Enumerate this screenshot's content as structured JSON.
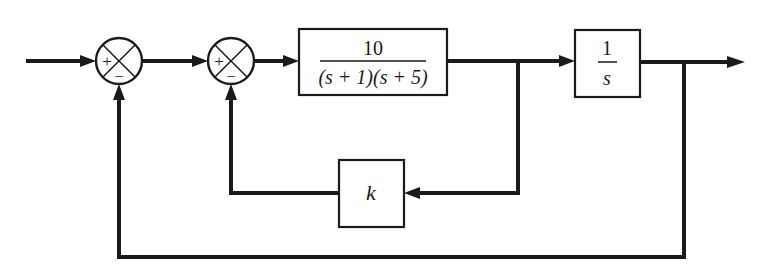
{
  "diagram": {
    "type": "control-system-block-diagram",
    "summing_junctions": [
      {
        "id": "sum1",
        "plus": "+",
        "minus": "−"
      },
      {
        "id": "sum2",
        "plus": "+",
        "minus": "−"
      }
    ],
    "blocks": {
      "plant1": {
        "numerator": "10",
        "denominator": "(s + 1)(s + 5)"
      },
      "integrator": {
        "numerator": "1",
        "denominator": "s"
      },
      "feedback_gain": {
        "label": "k"
      }
    },
    "colors": {
      "stroke": "#1a1a1a",
      "background": "#ffffff"
    }
  }
}
